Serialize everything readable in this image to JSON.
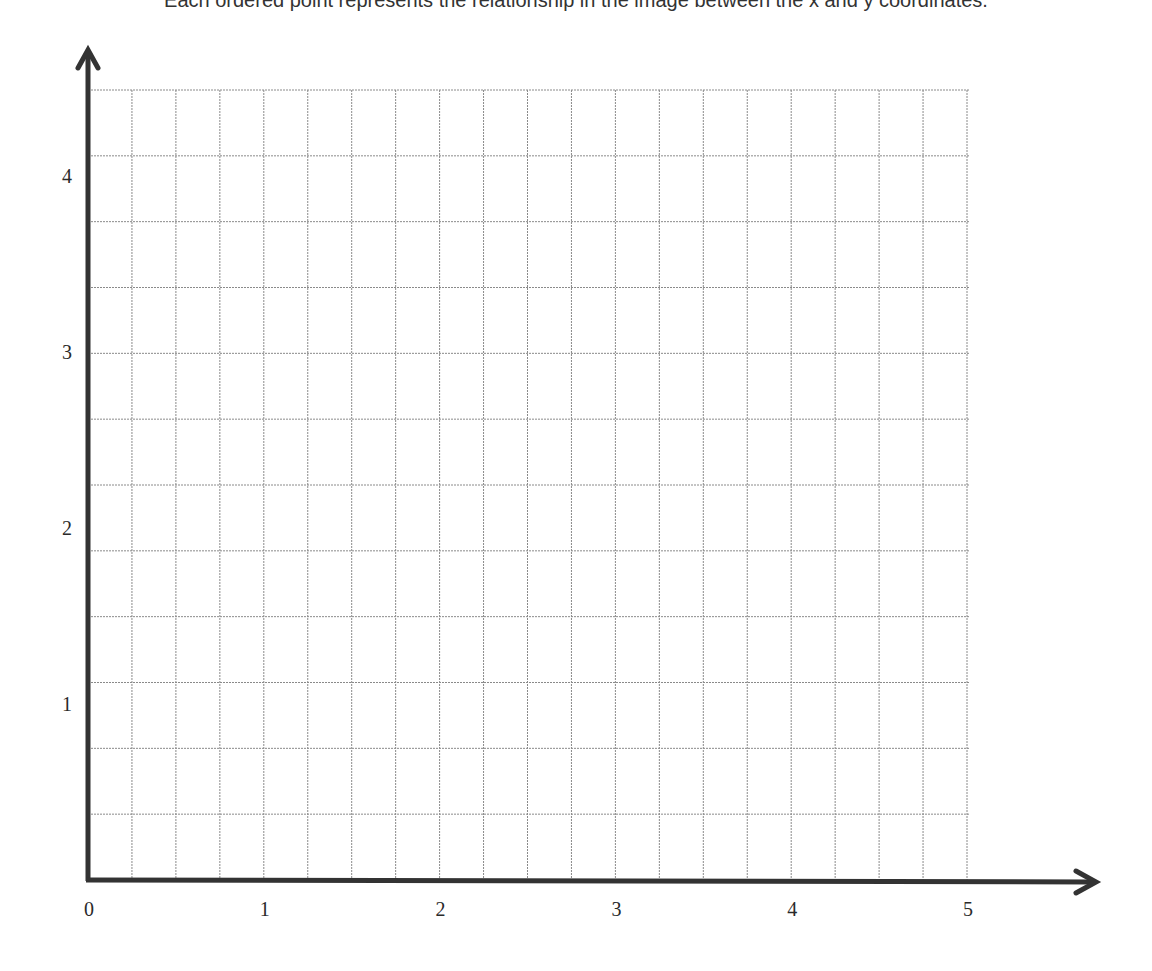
{
  "header": {
    "clipped_text": "Each ordered point represents the relationship in the image between the x and y coordinates."
  },
  "axes": {
    "color": "#333333",
    "grid_color": "#8a8a8a"
  },
  "chart_data": {
    "type": "scatter",
    "title": "",
    "xlabel": "",
    "ylabel": "",
    "x_ticks": [
      "0",
      "1",
      "2",
      "3",
      "4",
      "5"
    ],
    "y_ticks": [
      "1",
      "2",
      "3",
      "4"
    ],
    "xlim": [
      0,
      5
    ],
    "ylim": [
      0,
      4.5
    ],
    "grid": true,
    "grid_x_step": 0.25,
    "grid_y_step": 0.375,
    "series": [],
    "legend": null,
    "note": "Empty coordinate grid (first quadrant) with arrowed axes; no data points plotted."
  }
}
